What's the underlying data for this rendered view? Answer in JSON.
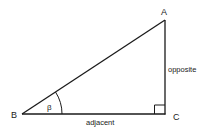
{
  "diagram": {
    "type": "right-triangle",
    "vertices": {
      "A": {
        "label": "A",
        "x": 165,
        "y": 20
      },
      "B": {
        "label": "B",
        "x": 22,
        "y": 114
      },
      "C": {
        "label": "C",
        "x": 165,
        "y": 114
      }
    },
    "angle_label": "β",
    "sides": {
      "opposite": "opposite",
      "adjacent": "adjacent"
    },
    "right_angle_at": "C",
    "line_color": "#1a1a1a"
  }
}
